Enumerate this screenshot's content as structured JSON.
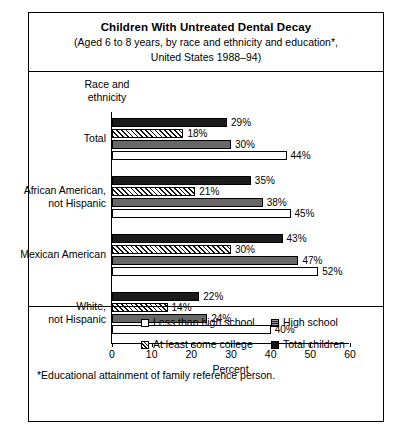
{
  "title": {
    "main": "Children With Untreated Dental Decay",
    "sub_line1": "(Aged 6 to 8 years, by race and ethnicity and education*,",
    "sub_line2": "United States 1988–94)"
  },
  "axis_head_line1": "Race and",
  "axis_head_line2": "ethnicity",
  "footnote": "*Educational attainment of family reference person.",
  "legend": {
    "items": [
      {
        "label": "Less than high school",
        "key": "lessthan",
        "color": "#ffffff"
      },
      {
        "label": "High school",
        "key": "highschool",
        "color": "#6d6d6d"
      },
      {
        "label": "At least some college",
        "key": "college",
        "color": "#ffffff"
      },
      {
        "label": "Total children",
        "key": "total",
        "color": "#141414"
      }
    ]
  },
  "chart_data": {
    "type": "bar",
    "orientation": "horizontal",
    "title": "Children With Untreated Dental Decay",
    "subtitle": "(Aged 6 to 8 years, by race and ethnicity and education*, United States 1988–94)",
    "xlabel": "Percent",
    "ylabel": "Race and ethnicity",
    "xlim": [
      0,
      60
    ],
    "xticks": [
      0,
      10,
      20,
      30,
      40,
      50,
      60
    ],
    "xticklabels": [
      "0",
      "10",
      "20",
      "30",
      "40",
      "50",
      "60"
    ],
    "grid": false,
    "legend_position": "bottom",
    "categories": [
      "Total",
      "African American, not Hispanic",
      "Mexican American",
      "White, not Hispanic"
    ],
    "series": [
      {
        "name": "Total children",
        "key": "total",
        "values": [
          29,
          35,
          43,
          22
        ],
        "labels": [
          "29%",
          "35%",
          "43%",
          "22%"
        ]
      },
      {
        "name": "At least some college",
        "key": "college",
        "values": [
          18,
          21,
          30,
          14
        ],
        "labels": [
          "18%",
          "21%",
          "30%",
          "14%"
        ]
      },
      {
        "name": "High school",
        "key": "highschool",
        "values": [
          30,
          38,
          47,
          24
        ],
        "labels": [
          "30%",
          "38%",
          "47%",
          "24%"
        ]
      },
      {
        "name": "Less than high school",
        "key": "lessthan",
        "values": [
          44,
          45,
          52,
          40
        ],
        "labels": [
          "44%",
          "45%",
          "52%",
          "40%"
        ]
      }
    ]
  }
}
